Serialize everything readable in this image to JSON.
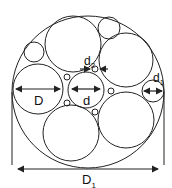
{
  "diagram": {
    "type": "circle-packing-cross-section",
    "labels": {
      "D": "D",
      "d": "d",
      "d1_base": "d",
      "d1_sub": "1",
      "d2_base": "d",
      "d2_sub": "2",
      "D1_base": "D",
      "D1_sub": "1"
    },
    "stroke_color": "#222222",
    "background": "#ffffff",
    "outer_circle": {
      "cx": 88,
      "cy": 92,
      "r": 76
    },
    "circles": [
      {
        "name": "left-large-circle",
        "cx": 38,
        "cy": 89,
        "r": 25
      },
      {
        "name": "center-circle",
        "cx": 86,
        "cy": 90,
        "r": 18
      },
      {
        "name": "top-large-circle",
        "cx": 73,
        "cy": 44,
        "r": 28
      },
      {
        "name": "top-small-circle",
        "cx": 109,
        "cy": 28,
        "r": 11
      },
      {
        "name": "top-left-small-circle",
        "cx": 34,
        "cy": 52,
        "r": 10
      },
      {
        "name": "right-upper-large-circle",
        "cx": 126,
        "cy": 60,
        "r": 27
      },
      {
        "name": "right-small-circle",
        "cx": 153,
        "cy": 91,
        "r": 11
      },
      {
        "name": "bottom-right-large-circle",
        "cx": 126,
        "cy": 120,
        "r": 28
      },
      {
        "name": "bottom-large-circle",
        "cx": 71,
        "cy": 133,
        "r": 28
      },
      {
        "name": "tiny-circle-1",
        "cx": 95,
        "cy": 69,
        "r": 3
      },
      {
        "name": "tiny-circle-2",
        "cx": 67,
        "cy": 77,
        "r": 3
      },
      {
        "name": "tiny-circle-3",
        "cx": 111,
        "cy": 91,
        "r": 3
      },
      {
        "name": "tiny-circle-4",
        "cx": 67,
        "cy": 103,
        "r": 3
      },
      {
        "name": "tiny-circle-5",
        "cx": 95,
        "cy": 112,
        "r": 3
      }
    ]
  }
}
